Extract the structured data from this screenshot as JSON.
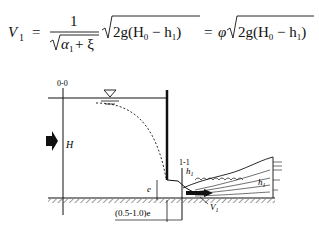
{
  "formula": {
    "lhs": "V",
    "lhs_sub": "1",
    "eq": "=",
    "frac_num": "1",
    "frac_den_alpha": "α",
    "frac_den_alpha_sub": "1",
    "frac_den_plus": "+ ξ",
    "root_term": "2g(H",
    "root_H_sub": "0",
    "root_minus": " − h",
    "root_h_sub": "1",
    "root_close": ")",
    "eq2": "=",
    "phi": "φ",
    "latex": "V_1 = \\frac{1}{\\sqrt{\\alpha_1+\\xi}}\\sqrt{2g(H_0-h_1)} = \\varphi\\sqrt{2g(H_0-h_1)}"
  },
  "diagram": {
    "section_00": "0-0",
    "section_11": "1-1",
    "label_H": "H",
    "label_h1_top": "h",
    "label_h1_top_sub": "1",
    "label_h1_right": "h",
    "label_h1_right_sub": "1",
    "label_e": "e",
    "label_V1": "V",
    "label_V1_sub": "1",
    "label_dist": "(0.5-1.0)e"
  }
}
